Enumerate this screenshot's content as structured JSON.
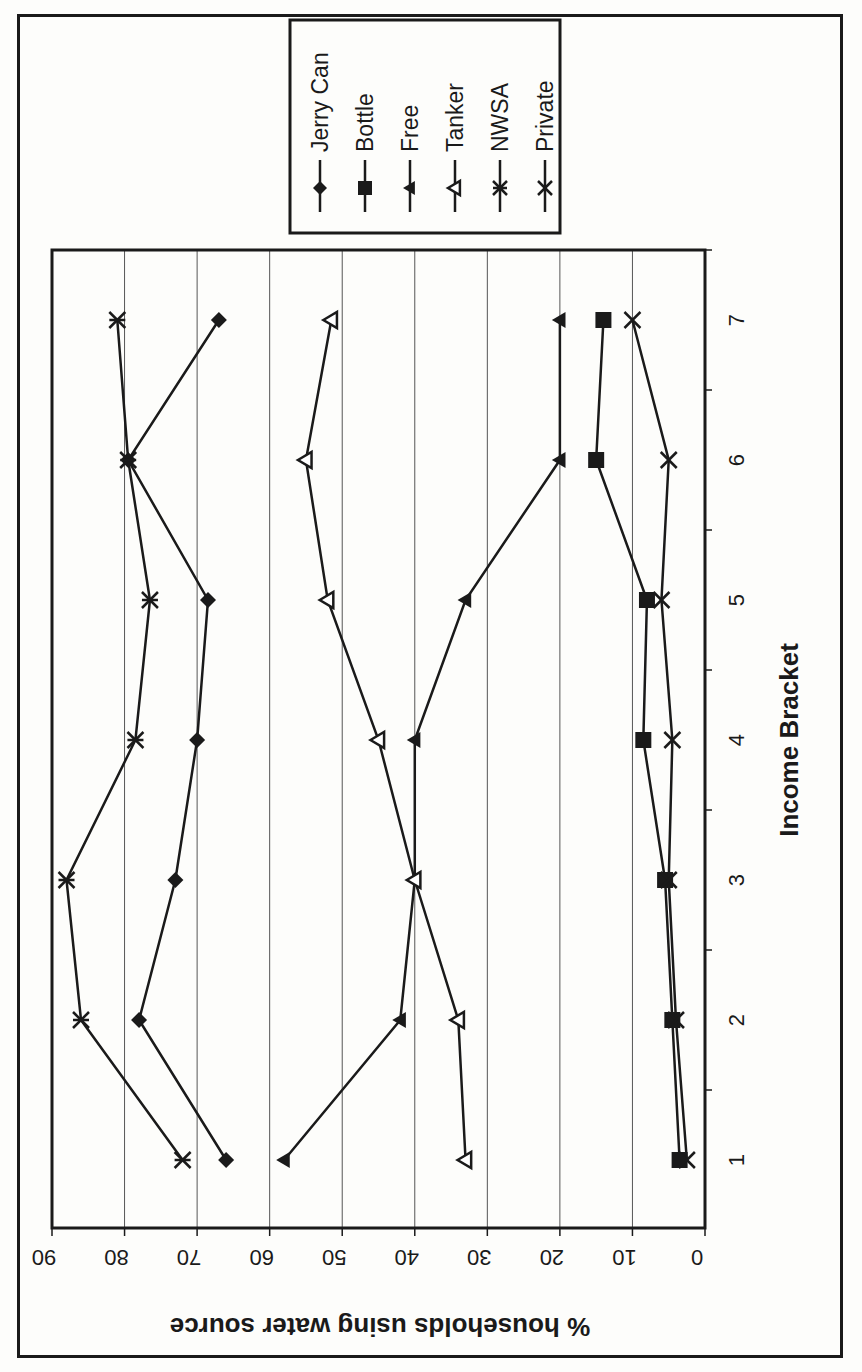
{
  "chart_data": {
    "type": "line",
    "title": "",
    "xlabel": "Income Bracket",
    "ylabel": "% households using water source",
    "categories": [
      "1",
      "2",
      "3",
      "4",
      "5",
      "6",
      "7"
    ],
    "ylim": [
      0,
      90
    ],
    "yticks": [
      0,
      10,
      20,
      30,
      40,
      50,
      60,
      70,
      80,
      90
    ],
    "grid": true,
    "orientation": "rotated 90° clockwise (y-axis horizontal at bottom, reading reversed)",
    "legend_position": "top-right (rotated)",
    "series": [
      {
        "name": "Jerry Can",
        "marker": "diamond-filled",
        "values": [
          66,
          78,
          73,
          70,
          68.5,
          79.5,
          67
        ]
      },
      {
        "name": "Bottle",
        "marker": "square-filled",
        "values": [
          3.5,
          4.5,
          5.5,
          8.5,
          8,
          15,
          14
        ]
      },
      {
        "name": "Free",
        "marker": "triangle-filled",
        "values": [
          58,
          42,
          40,
          40,
          33,
          20,
          20
        ]
      },
      {
        "name": "Tanker",
        "marker": "triangle-open",
        "values": [
          33,
          34,
          40,
          45,
          52,
          55,
          51.5
        ]
      },
      {
        "name": "NWSA",
        "marker": "asterisk",
        "values": [
          72,
          86,
          88,
          78.5,
          76.5,
          79.5,
          81
        ]
      },
      {
        "name": "Private",
        "marker": "x-cross",
        "values": [
          2.5,
          4,
          5,
          4.5,
          6,
          5,
          10
        ]
      }
    ]
  },
  "axis": {
    "x_title": "Income Bracket",
    "y_title": "% households using water source"
  },
  "legend": {
    "items": [
      "Jerry Can",
      "Bottle",
      "Free",
      "Tanker",
      "NWSA",
      "Private"
    ]
  },
  "colors": {
    "ink": "#1a1a1a",
    "grid": "#555555",
    "background": "#fdfdfb"
  }
}
